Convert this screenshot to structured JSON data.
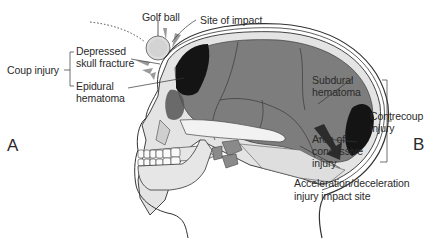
{
  "figure": {
    "panel_left": "A",
    "panel_right": "B",
    "labels": {
      "golf_ball": "Golf ball",
      "site_of_impact": "Site of impact",
      "coup_injury": "Coup injury",
      "depressed_fracture_l1": "Depressed",
      "depressed_fracture_l2": "skull fracture",
      "epidural_l1": "Epidural",
      "epidural_l2": "hematoma",
      "subdural_l1": "Subdural",
      "subdural_l2": "hematoma",
      "contrecoup_l1": "Contrecoup",
      "contrecoup_l2": "injury",
      "concussive_l1": "Area of",
      "concussive_l2": "concussive",
      "concussive_l3": "injury",
      "accel_l1": "Acceleration/deceleration",
      "accel_l2": "injury impact site"
    },
    "colors": {
      "brain": "#7d7d7d",
      "hematoma": "#141414",
      "bone": "#e6e6e6",
      "outline": "#2a2a2a"
    }
  }
}
